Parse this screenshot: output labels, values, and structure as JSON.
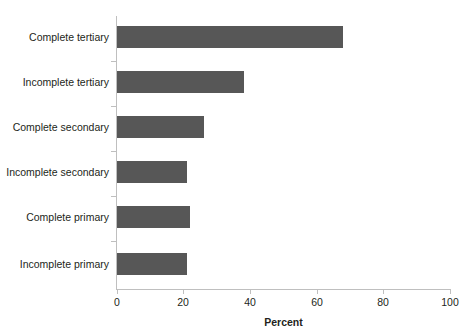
{
  "chart_data": {
    "type": "bar",
    "orientation": "horizontal",
    "title": "",
    "subtitle": "",
    "xlabel": "Percent",
    "ylabel": "",
    "categories": [
      "Complete tertiary",
      "Incomplete tertiary",
      "Complete secondary",
      "Incomplete secondary",
      "Complete primary",
      "Incomplete primary"
    ],
    "values": [
      68,
      38,
      26,
      21,
      22,
      21
    ],
    "xlim": [
      0,
      100
    ],
    "xticks": [
      0,
      20,
      40,
      60,
      80,
      100
    ],
    "xtick_labels": [
      "0",
      "20",
      "40",
      "60",
      "80",
      "100"
    ],
    "grid": false,
    "legend": null,
    "series": [
      {
        "name": "Percent",
        "values": [
          68,
          38,
          26,
          21,
          22,
          21
        ]
      }
    ]
  },
  "style": {
    "bar_color": "#575757",
    "axis_color": "#bfbfbf",
    "text_color": "#231f20",
    "background": "#ffffff"
  },
  "caption_ghost": ""
}
